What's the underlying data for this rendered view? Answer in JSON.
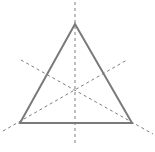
{
  "diagram": {
    "colors": {
      "triangle_stroke": "#7a7a7a",
      "axis_stroke": "#6f6f6f",
      "background": "#ffffff"
    },
    "triangle": {
      "vertices": [
        {
          "name": "apex",
          "x": 75,
          "y": 24
        },
        {
          "name": "bottom-left",
          "x": 20,
          "y": 123
        },
        {
          "name": "bottom-right",
          "x": 132,
          "y": 123
        }
      ]
    },
    "symmetry_axes": [
      {
        "name": "vertical-axis",
        "x1": 75,
        "y1": 2,
        "x2": 75,
        "y2": 143
      },
      {
        "name": "descending-axis",
        "x1": 21,
        "y1": 60,
        "x2": 153,
        "y2": 134
      },
      {
        "name": "ascending-axis",
        "x1": 3,
        "y1": 131,
        "x2": 127,
        "y2": 60
      }
    ],
    "axis_count": 3
  }
}
